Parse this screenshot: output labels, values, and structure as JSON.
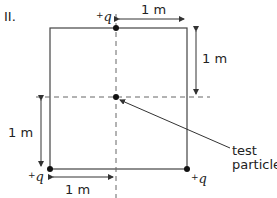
{
  "figure": {
    "label": "II.",
    "charges": [
      {
        "id": "top",
        "sign": "+",
        "symbol": "q",
        "position": "top edge midpoint"
      },
      {
        "id": "bottom-left",
        "sign": "+",
        "symbol": "q",
        "position": "bottom-left corner"
      },
      {
        "id": "bottom-right",
        "sign": "+",
        "symbol": "q",
        "position": "bottom-right corner"
      }
    ],
    "dimensions": {
      "top": "1 m",
      "right": "1 m",
      "left": "1 m",
      "bottom": "1 m"
    },
    "test_particle": {
      "line1": "test",
      "line2": "particle",
      "position": "center of square"
    },
    "colors": {
      "line": "#444444",
      "dot": "#111111",
      "dash": "#666666"
    }
  }
}
